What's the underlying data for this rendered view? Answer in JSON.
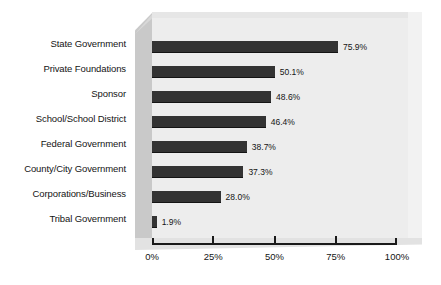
{
  "chart_data": {
    "type": "bar",
    "orientation": "horizontal",
    "title": "",
    "xlabel": "",
    "ylabel": "",
    "xlim": [
      0,
      100
    ],
    "grid": false,
    "legend": null,
    "value_suffix": "%",
    "categories": [
      "State Government",
      "Private Foundations",
      "Sponsor",
      "School/School District",
      "Federal Government",
      "County/City Government",
      "Corporations/Business",
      "Tribal Government"
    ],
    "values": [
      75.9,
      50.1,
      48.6,
      46.4,
      38.7,
      37.3,
      28.0,
      1.9
    ],
    "value_labels": [
      "75.9%",
      "50.1%",
      "48.6%",
      "46.4%",
      "38.7%",
      "37.3%",
      "28.0%",
      "1.9%"
    ],
    "xticks": [
      0,
      25,
      50,
      75,
      100
    ],
    "xtick_labels": [
      "0%",
      "25%",
      "50%",
      "75%",
      "100%"
    ],
    "colors": {
      "bar": "#333333",
      "plot_floor": "#ededed",
      "plot_wall": "#c9c9c9",
      "text": "#141414",
      "axis": "#1a1a1a",
      "background": "#ffffff"
    }
  }
}
